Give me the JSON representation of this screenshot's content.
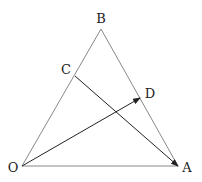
{
  "diagram": {
    "type": "geometry",
    "points": {
      "O": {
        "label": "O",
        "x": 22,
        "y": 166,
        "label_x": 13,
        "label_y": 167
      },
      "A": {
        "label": "A",
        "x": 178,
        "y": 166,
        "label_x": 187,
        "label_y": 167
      },
      "B": {
        "label": "B",
        "x": 101,
        "y": 29,
        "label_x": 101,
        "label_y": 18
      },
      "C": {
        "label": "C",
        "x": 75,
        "y": 76,
        "label_x": 66,
        "label_y": 69
      },
      "D": {
        "label": "D",
        "x": 140,
        "y": 98,
        "label_x": 150,
        "label_y": 93
      }
    },
    "segments": [
      {
        "from": "O",
        "to": "A"
      },
      {
        "from": "O",
        "to": "B"
      },
      {
        "from": "B",
        "to": "A"
      }
    ],
    "arrows": [
      {
        "from": "O",
        "to": "D"
      },
      {
        "from": "C",
        "to": "A"
      }
    ],
    "colors": {
      "triangle": "#888888",
      "arrow": "#222222",
      "text": "#222222"
    }
  }
}
